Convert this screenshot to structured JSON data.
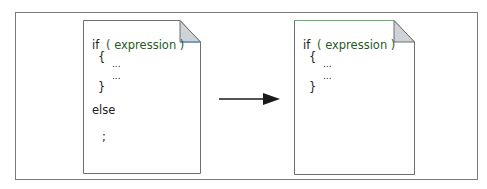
{
  "diagram": {
    "type": "code-transformation",
    "colors": {
      "frame_border": "#7a7a7a",
      "page_border": "#6e6e6e",
      "corner_fill": "#cfd3d8",
      "corner_edge": "#5b8fd0",
      "expression_text": "#1f5c1f",
      "arrow": "#1a1a1a"
    },
    "left_page": {
      "lines": {
        "if_kw": "if",
        "expr": "( expression )",
        "open_brace": "{",
        "dots1": "...",
        "dots2": "...",
        "close_brace": "}",
        "else_kw": "else",
        "semicolon": ";"
      }
    },
    "arrow": {
      "direction": "right"
    },
    "right_page": {
      "lines": {
        "if_kw": "if",
        "expr": "( expression )",
        "open_brace": "{",
        "dots1": "...",
        "dots2": "...",
        "close_brace": "}"
      }
    }
  }
}
